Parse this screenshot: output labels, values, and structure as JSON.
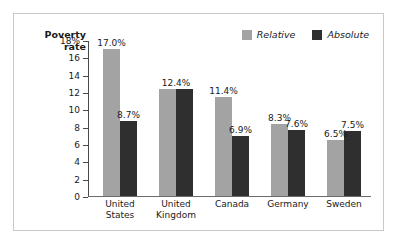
{
  "figure": {
    "axis_title": "Poverty\nrate",
    "background_color": "#ffffff",
    "border_color": "#c9c9c9"
  },
  "legend": {
    "position": "top-right",
    "items": [
      {
        "label": "Relative",
        "color": "#a3a3a3"
      },
      {
        "label": "Absolute",
        "color": "#2f2f2f"
      }
    ]
  },
  "axis": {
    "ticks": [
      {
        "label": "18%",
        "value": 18
      },
      {
        "label": "16",
        "value": 16
      },
      {
        "label": "14",
        "value": 14
      },
      {
        "label": "12",
        "value": 12
      },
      {
        "label": "10",
        "value": 10
      },
      {
        "label": "8",
        "value": 8
      },
      {
        "label": "6",
        "value": 6
      },
      {
        "label": "4",
        "value": 4
      },
      {
        "label": "2",
        "value": 2
      },
      {
        "label": "0",
        "value": 0
      }
    ]
  },
  "categories_display": [
    "United\nStates",
    "United\nKingdom",
    "Canada",
    "Germany",
    "Sweden"
  ],
  "bar_labels": [
    {
      "relative": "17.0%",
      "absolute": "8.7%",
      "merged": null
    },
    {
      "relative": null,
      "absolute": null,
      "merged": "12.4%"
    },
    {
      "relative": "11.4%",
      "absolute": "6.9%",
      "merged": null
    },
    {
      "relative": "8.3%",
      "absolute": "7.6%",
      "merged": null
    },
    {
      "relative": "6.5%",
      "absolute": "7.5%",
      "merged": null
    }
  ],
  "chart_data": {
    "type": "bar",
    "title": "",
    "xlabel": "",
    "ylabel": "Poverty rate",
    "ylim": [
      0,
      18
    ],
    "ytick_values": [
      0,
      2,
      4,
      6,
      8,
      10,
      12,
      14,
      16,
      18
    ],
    "ytick_labels": [
      "0",
      "2",
      "4",
      "6",
      "8",
      "10",
      "12",
      "14",
      "16",
      "18%"
    ],
    "grid": false,
    "legend_position": "top-right",
    "categories": [
      "United States",
      "United Kingdom",
      "Canada",
      "Germany",
      "Sweden"
    ],
    "series": [
      {
        "name": "Relative",
        "color": "#a3a3a3",
        "values": [
          17.0,
          12.4,
          11.4,
          8.3,
          6.5
        ],
        "value_labels": [
          "17.0%",
          "12.4%",
          "11.4%",
          "8.3%",
          "6.5%"
        ]
      },
      {
        "name": "Absolute",
        "color": "#2f2f2f",
        "values": [
          8.7,
          12.4,
          6.9,
          7.6,
          7.5
        ],
        "value_labels": [
          "8.7%",
          "12.4%",
          "6.9%",
          "7.6%",
          "7.5%"
        ]
      }
    ]
  }
}
